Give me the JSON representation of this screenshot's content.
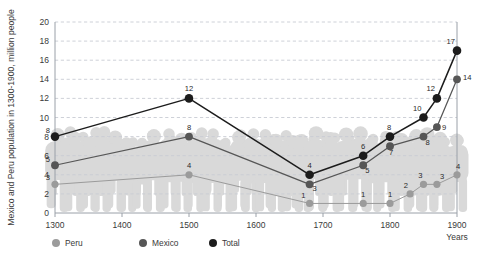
{
  "chart_data": {
    "type": "line",
    "title": "",
    "subtitle": "",
    "xlabel": "Years",
    "ylabel": "Mexico and Peru population in 1300-1900, million people",
    "xlim": [
      1300,
      1900
    ],
    "ylim": [
      0,
      20
    ],
    "grid": true,
    "grid_style": "dashed-horizontal",
    "legend_position": "bottom-left",
    "x_ticks": [
      "1300",
      "1400",
      "1500",
      "1600",
      "1700",
      "1800",
      "1900"
    ],
    "y_ticks": [
      "0",
      "2",
      "4",
      "6",
      "8",
      "10",
      "12",
      "14",
      "16",
      "18",
      "20"
    ],
    "background_motif": "crowd-of-people-silhouette",
    "series": [
      {
        "name": "Peru",
        "color": "#9b9b9b",
        "x": [
          1300,
          1500,
          1680,
          1760,
          1800,
          1830,
          1850,
          1870,
          1900
        ],
        "values": [
          3,
          4,
          1,
          1,
          1,
          2,
          3,
          3,
          4
        ],
        "labels": [
          "3",
          "4",
          "1",
          "1",
          "1",
          "2",
          "3",
          "3",
          "4"
        ]
      },
      {
        "name": "Mexico",
        "color": "#565656",
        "x": [
          1300,
          1500,
          1680,
          1760,
          1800,
          1850,
          1870,
          1900
        ],
        "values": [
          5,
          8,
          3,
          5,
          7,
          8,
          9,
          14
        ],
        "labels": [
          "5",
          "8",
          "3",
          "5",
          "7",
          "8",
          "9",
          "14"
        ]
      },
      {
        "name": "Total",
        "color": "#1c1c1c",
        "x": [
          1300,
          1500,
          1680,
          1760,
          1800,
          1850,
          1870,
          1900
        ],
        "values": [
          8,
          12,
          4,
          6,
          8,
          10,
          12,
          17
        ],
        "labels": [
          "8",
          "12",
          "4",
          "6",
          "8",
          "10",
          "12",
          "17"
        ]
      }
    ]
  },
  "legend": {
    "items": [
      {
        "label": "Peru",
        "color": "#9b9b9b"
      },
      {
        "label": "Mexico",
        "color": "#565656"
      },
      {
        "label": "Total",
        "color": "#1c1c1c"
      }
    ]
  },
  "axes": {
    "y_title": "Mexico and Peru population in 1300-1900, million people",
    "x_title": "Years"
  },
  "colors": {
    "peru": "#9b9b9b",
    "mexico": "#565656",
    "total": "#1c1c1c",
    "grid": "#c8ccd4",
    "axis": "#9aa0a8",
    "silhouette": "#d9d9d9",
    "background": "#ffffff"
  }
}
